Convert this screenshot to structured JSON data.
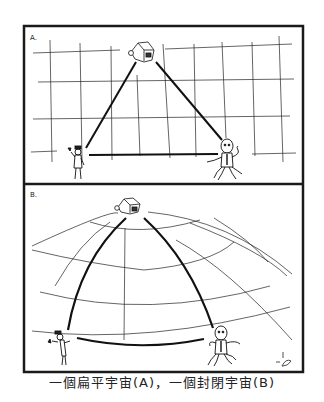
{
  "figure": {
    "panels": [
      {
        "label": "A.",
        "description": "flat universe: triangle of three figures on a rectangular grid"
      },
      {
        "label": "B.",
        "description": "closed universe: triangle of three figures on a curved spherical grid"
      }
    ],
    "caption": "一個扁平宇宙(A)，一個封閉宇宙(B)",
    "colors": {
      "ink": "#1a1a1a",
      "paper": "#ffffff"
    }
  }
}
